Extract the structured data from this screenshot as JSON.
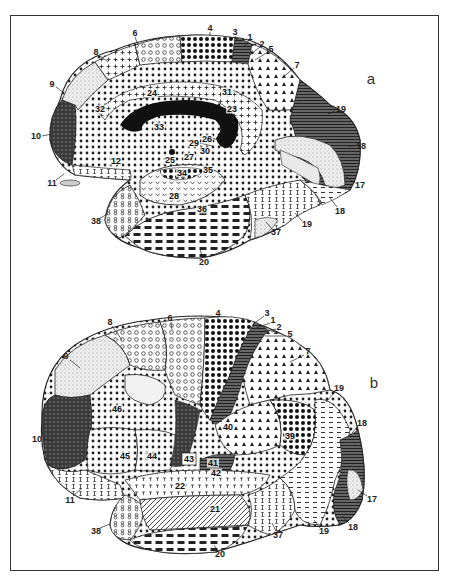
{
  "figure": {
    "panels": [
      {
        "id": "a",
        "letter": "a",
        "view": "medial",
        "labels": [
          {
            "text": "6",
            "x": 135,
            "y": 33
          },
          {
            "text": "4",
            "x": 210,
            "y": 28
          },
          {
            "text": "3",
            "x": 235,
            "y": 32
          },
          {
            "text": "1",
            "x": 250,
            "y": 37
          },
          {
            "text": "2",
            "x": 262,
            "y": 44
          },
          {
            "text": "5",
            "x": 271,
            "y": 49
          },
          {
            "text": "7",
            "x": 297,
            "y": 65
          },
          {
            "text": "8",
            "x": 96,
            "y": 52
          },
          {
            "text": "9",
            "x": 52,
            "y": 84
          },
          {
            "text": "10",
            "x": 36,
            "y": 136
          },
          {
            "text": "11",
            "x": 52,
            "y": 183
          },
          {
            "text": "12",
            "x": 116,
            "y": 161,
            "inner": true
          },
          {
            "text": "24",
            "x": 152,
            "y": 93,
            "inner": true
          },
          {
            "text": "31",
            "x": 227,
            "y": 92,
            "inner": true
          },
          {
            "text": "23",
            "x": 232,
            "y": 109,
            "inner": true
          },
          {
            "text": "32",
            "x": 100,
            "y": 109,
            "inner": true
          },
          {
            "text": "33",
            "x": 159,
            "y": 127,
            "inner": true
          },
          {
            "text": "26",
            "x": 207,
            "y": 139,
            "inner": true
          },
          {
            "text": "29",
            "x": 194,
            "y": 143,
            "inner": true
          },
          {
            "text": "30",
            "x": 205,
            "y": 151,
            "inner": true
          },
          {
            "text": "27",
            "x": 189,
            "y": 157,
            "inner": true
          },
          {
            "text": "25",
            "x": 170,
            "y": 160,
            "inner": true
          },
          {
            "text": "34",
            "x": 182,
            "y": 173,
            "inner": true
          },
          {
            "text": "35",
            "x": 208,
            "y": 170,
            "inner": true
          },
          {
            "text": "28",
            "x": 174,
            "y": 196,
            "inner": true
          },
          {
            "text": "36",
            "x": 202,
            "y": 209,
            "inner": true
          },
          {
            "text": "38",
            "x": 96,
            "y": 221
          },
          {
            "text": "20",
            "x": 204,
            "y": 262
          },
          {
            "text": "37",
            "x": 276,
            "y": 232
          },
          {
            "text": "19",
            "x": 307,
            "y": 224
          },
          {
            "text": "19",
            "x": 341,
            "y": 109
          },
          {
            "text": "18",
            "x": 361,
            "y": 146
          },
          {
            "text": "17",
            "x": 360,
            "y": 185
          },
          {
            "text": "18",
            "x": 340,
            "y": 211
          }
        ]
      },
      {
        "id": "b",
        "letter": "b",
        "view": "lateral",
        "labels": [
          {
            "text": "8",
            "x": 110,
            "y": 322
          },
          {
            "text": "6",
            "x": 170,
            "y": 318
          },
          {
            "text": "4",
            "x": 218,
            "y": 313
          },
          {
            "text": "3",
            "x": 267,
            "y": 313
          },
          {
            "text": "1",
            "x": 273,
            "y": 320
          },
          {
            "text": "2",
            "x": 279,
            "y": 327
          },
          {
            "text": "5",
            "x": 290,
            "y": 334
          },
          {
            "text": "7",
            "x": 308,
            "y": 351
          },
          {
            "text": "9",
            "x": 66,
            "y": 356
          },
          {
            "text": "10",
            "x": 37,
            "y": 439
          },
          {
            "text": "11",
            "x": 70,
            "y": 500
          },
          {
            "text": "46",
            "x": 117,
            "y": 409,
            "inner": true
          },
          {
            "text": "45",
            "x": 125,
            "y": 456,
            "inner": true
          },
          {
            "text": "44",
            "x": 152,
            "y": 456,
            "inner": true
          },
          {
            "text": "43",
            "x": 189,
            "y": 459,
            "inner": true
          },
          {
            "text": "40",
            "x": 228,
            "y": 427,
            "inner": true
          },
          {
            "text": "39",
            "x": 290,
            "y": 436,
            "inner": true
          },
          {
            "text": "41",
            "x": 213,
            "y": 463,
            "inner": true
          },
          {
            "text": "42",
            "x": 216,
            "y": 473,
            "inner": true
          },
          {
            "text": "22",
            "x": 180,
            "y": 486,
            "inner": true
          },
          {
            "text": "21",
            "x": 215,
            "y": 509,
            "inner": true
          },
          {
            "text": "38",
            "x": 96,
            "y": 531
          },
          {
            "text": "20",
            "x": 220,
            "y": 554
          },
          {
            "text": "37",
            "x": 278,
            "y": 535
          },
          {
            "text": "19",
            "x": 324,
            "y": 531
          },
          {
            "text": "19",
            "x": 339,
            "y": 388
          },
          {
            "text": "18",
            "x": 362,
            "y": 423
          },
          {
            "text": "17",
            "x": 372,
            "y": 499
          },
          {
            "text": "18",
            "x": 353,
            "y": 527
          }
        ]
      }
    ]
  }
}
